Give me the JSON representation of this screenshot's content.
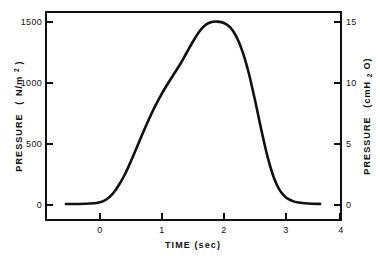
{
  "chart_data": {
    "type": "line",
    "title": "",
    "xlabel": "TIME (sec)",
    "ylabel": "PRESSURE  ( N/m²)",
    "ylabel_right": "PRESSURE  (cmH₂O)",
    "xlim": [
      -1,
      4
    ],
    "ylim": [
      0,
      1600
    ],
    "ylim_right": [
      0,
      16
    ],
    "grid": false,
    "legend": null,
    "xticks": [
      0,
      1,
      2,
      3,
      4
    ],
    "xticklabels": [
      "0",
      "1",
      "2",
      "3",
      "4"
    ],
    "yticks": [
      0,
      500,
      1000,
      1500
    ],
    "yticklabels": [
      "0",
      "500",
      "1000",
      "1500"
    ],
    "yticks_right": [
      0,
      5,
      10,
      15
    ],
    "yticklabels_right": [
      "0",
      "5",
      "10",
      "15"
    ],
    "series": [
      {
        "name": "airway pressure",
        "color": "#111111",
        "linewidth": 2.6,
        "x": [
          -0.55,
          -0.4,
          -0.25,
          -0.1,
          0.0,
          0.1,
          0.2,
          0.3,
          0.4,
          0.5,
          0.6,
          0.7,
          0.8,
          0.9,
          1.0,
          1.1,
          1.2,
          1.3,
          1.4,
          1.5,
          1.6,
          1.7,
          1.8,
          1.9,
          2.0,
          2.1,
          2.2,
          2.3,
          2.4,
          2.5,
          2.6,
          2.7,
          2.8,
          2.9,
          3.0,
          3.1,
          3.2,
          3.35,
          3.55
        ],
        "y": [
          8,
          8,
          10,
          14,
          22,
          45,
          90,
          160,
          250,
          360,
          480,
          600,
          715,
          820,
          915,
          1000,
          1080,
          1160,
          1250,
          1340,
          1420,
          1475,
          1500,
          1503,
          1492,
          1455,
          1380,
          1255,
          1080,
          860,
          620,
          400,
          230,
          120,
          62,
          34,
          20,
          12,
          9
        ]
      }
    ],
    "annotations": [],
    "peak": {
      "x": 1.9,
      "y": 1500,
      "y_right": 15
    },
    "baseline": {
      "y": 0,
      "y_right": 0
    }
  },
  "axes": {
    "left": {
      "title_main": "PRESSURE",
      "title_unit_open": "(",
      "title_unit_n": "N/m",
      "title_unit_exp": "2",
      "title_unit_close": ")",
      "labels": [
        "1500",
        "1000",
        "500",
        "0"
      ]
    },
    "right": {
      "title_main": "PRESSURE",
      "title_unit_open": "(cmH",
      "title_unit_sub": "2",
      "title_unit_close": "O)",
      "labels": [
        "15",
        "10",
        "5",
        "0"
      ]
    },
    "bottom": {
      "title": "TIME (sec)",
      "labels": [
        "0",
        "1",
        "2",
        "3",
        "4"
      ]
    }
  }
}
